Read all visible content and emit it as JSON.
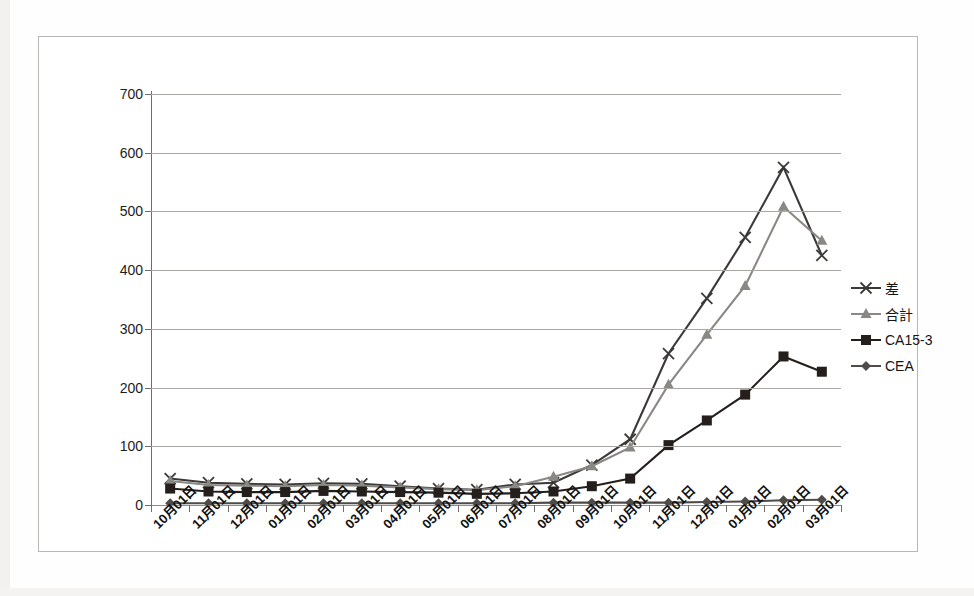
{
  "chart_data": {
    "type": "line",
    "title": "",
    "subtitle": "",
    "xlabel": "",
    "ylabel": "",
    "ylim": [
      0,
      700
    ],
    "ytick_labels": [
      "700",
      "600",
      "500",
      "400",
      "300",
      "200",
      "100",
      "0"
    ],
    "ytick_values": [
      700,
      600,
      500,
      400,
      300,
      200,
      100,
      0
    ],
    "grid": true,
    "legend_position": "right",
    "categories": [
      "10月01日",
      "11月01日",
      "12月01日",
      "01月01日",
      "02月01日",
      "03月01日",
      "04月01日",
      "05月01日",
      "06月01日",
      "07月01日",
      "08月01日",
      "09月01日",
      "10月01日",
      "11月01日",
      "12月01日",
      "01月01日",
      "02月01日",
      "03月01日"
    ],
    "series": [
      {
        "name": "差",
        "marker": "x",
        "color": "#3c3a38",
        "values": [
          45,
          38,
          36,
          35,
          37,
          36,
          32,
          28,
          26,
          35,
          38,
          68,
          112,
          258,
          352,
          456,
          575,
          425
        ]
      },
      {
        "name": "合計",
        "marker": "triangle",
        "color": "#8a8884",
        "values": [
          41,
          34,
          33,
          32,
          34,
          33,
          30,
          27,
          25,
          32,
          48,
          66,
          98,
          205,
          290,
          373,
          508,
          450
        ]
      },
      {
        "name": "CA15-3",
        "marker": "square",
        "color": "#241f1c",
        "values": [
          28,
          23,
          22,
          22,
          24,
          23,
          22,
          21,
          19,
          20,
          23,
          32,
          45,
          102,
          144,
          188,
          253,
          227
        ]
      },
      {
        "name": "CEA",
        "marker": "diamond",
        "color": "#4e4b48",
        "values": [
          3,
          3,
          3,
          3,
          3,
          3,
          3,
          3,
          3,
          3,
          4,
          4,
          4,
          4,
          5,
          6,
          8,
          9
        ]
      }
    ]
  },
  "legend": {
    "entries": [
      {
        "label": "差",
        "marker": "x-marker-icon"
      },
      {
        "label": "合計",
        "marker": "triangle-marker-icon"
      },
      {
        "label": "CA15-3",
        "marker": "square-marker-icon"
      },
      {
        "label": "CEA",
        "marker": "diamond-marker-icon"
      }
    ]
  },
  "colors": {
    "series_sa": "#3c3a38",
    "series_goukei": "#8a8884",
    "series_ca153": "#241f1c",
    "series_cea": "#4e4b48",
    "gridline": "#a9a7a3",
    "frame_border": "#b9b7b3"
  }
}
